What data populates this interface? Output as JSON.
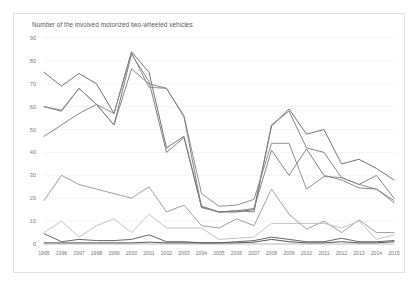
{
  "chart": {
    "title": "Number of the involved motorized two-wheeled vehicles"
  },
  "chart_data": {
    "type": "line",
    "title": "Number of the involved motorized two-wheeled vehicles",
    "xlabel": "",
    "ylabel": "",
    "ylim": [
      0,
      90
    ],
    "ytick_step": 10,
    "grid": true,
    "legend": "none",
    "x": [
      1995,
      1996,
      1997,
      1998,
      1999,
      2000,
      2001,
      2002,
      2003,
      2004,
      2005,
      2006,
      2007,
      2008,
      2009,
      2010,
      2011,
      2012,
      2013,
      2014,
      2015
    ],
    "yticks": [
      0,
      10,
      20,
      30,
      40,
      50,
      60,
      70,
      80,
      90
    ],
    "xticks": [
      "1995",
      "1996",
      "1997",
      "1998",
      "1999",
      "2000",
      "2001",
      "2002",
      "2003",
      "2004",
      "2005",
      "2006",
      "2007",
      "2008",
      "2009",
      "2010",
      "2011",
      "2012",
      "2013",
      "2014",
      "2015"
    ],
    "series": [
      {
        "name": "series-1",
        "color": "#6b6b6b",
        "values": [
          75,
          69,
          74.5,
          70,
          57,
          84,
          75,
          42,
          47,
          16.5,
          14,
          14,
          15,
          51.5,
          59,
          48,
          50,
          35,
          37,
          33,
          28
        ]
      },
      {
        "name": "series-2",
        "color": "#7d7d7d",
        "values": [
          60,
          58,
          68,
          61,
          52,
          83,
          71,
          40,
          46.5,
          16,
          14,
          14.5,
          14,
          52,
          58,
          42,
          40,
          29,
          26,
          30,
          20
        ]
      },
      {
        "name": "series-3",
        "color": "#8a8a8a",
        "values": [
          60,
          58.5,
          68,
          61,
          57,
          83.5,
          68.5,
          68,
          56,
          22,
          16.5,
          17,
          19.5,
          44,
          44,
          24,
          29.5,
          29,
          26,
          24,
          18
        ]
      },
      {
        "name": "series-4",
        "color": "#808080",
        "values": [
          47,
          52,
          57,
          61,
          52,
          76.5,
          70,
          68,
          55.5,
          16,
          14,
          14.5,
          15.5,
          41,
          30,
          41.5,
          30,
          28,
          24.5,
          24,
          19
        ]
      },
      {
        "name": "series-5",
        "color": "#9a9a9a",
        "values": [
          19,
          30,
          26,
          24,
          22,
          20,
          25,
          14,
          17,
          8,
          7,
          11,
          8,
          24,
          13,
          6.5,
          10,
          5,
          10.5,
          5,
          5
        ]
      },
      {
        "name": "series-6",
        "color": "#bfbfbf",
        "values": [
          5,
          10,
          3,
          8,
          11,
          5,
          13,
          7,
          7,
          7,
          2,
          2.5,
          3,
          9,
          9,
          9,
          9,
          7,
          10,
          2,
          4
        ]
      },
      {
        "name": "series-7",
        "color": "#5e5e5e",
        "values": [
          4.5,
          1,
          2,
          1.5,
          1.5,
          2,
          4,
          1,
          1,
          0.5,
          0.5,
          1,
          1.5,
          3,
          2,
          1,
          1,
          2.5,
          1,
          1,
          1.5
        ]
      },
      {
        "name": "series-8",
        "color": "#4f4f4f",
        "values": [
          0.5,
          0.5,
          0.5,
          0.5,
          0.5,
          0.5,
          0.8,
          0.5,
          0.5,
          0.5,
          0.5,
          0.5,
          0.8,
          2,
          1,
          0.5,
          0.5,
          1,
          0.5,
          0.5,
          1
        ]
      }
    ]
  }
}
